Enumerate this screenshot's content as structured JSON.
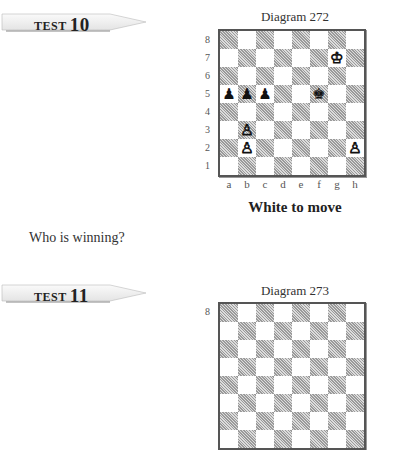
{
  "tests": [
    {
      "tag_word": "TEST",
      "tag_number": "10",
      "diagram": {
        "title": "Diagram 272",
        "ranks": [
          "8",
          "7",
          "6",
          "5",
          "4",
          "3",
          "2",
          "1"
        ],
        "files": [
          "a",
          "b",
          "c",
          "d",
          "e",
          "f",
          "g",
          "h"
        ],
        "pieces": [
          {
            "square": "g7",
            "glyph": "♔",
            "color": "white",
            "name": "white-king"
          },
          {
            "square": "a5",
            "glyph": "♟",
            "color": "black",
            "name": "black-pawn"
          },
          {
            "square": "b5",
            "glyph": "♟",
            "color": "black",
            "name": "black-pawn"
          },
          {
            "square": "c5",
            "glyph": "♟",
            "color": "black",
            "name": "black-pawn"
          },
          {
            "square": "f5",
            "glyph": "♚",
            "color": "black",
            "name": "black-king"
          },
          {
            "square": "b3",
            "glyph": "♙",
            "color": "white",
            "name": "white-pawn"
          },
          {
            "square": "b2",
            "glyph": "♙",
            "color": "white",
            "name": "white-pawn"
          },
          {
            "square": "h2",
            "glyph": "♙",
            "color": "white",
            "name": "white-pawn"
          }
        ],
        "caption": "White to move"
      },
      "question": "Who is winning?"
    },
    {
      "tag_word": "TEST",
      "tag_number": "11",
      "diagram": {
        "title": "Diagram 273",
        "ranks": [
          "8"
        ]
      }
    }
  ]
}
